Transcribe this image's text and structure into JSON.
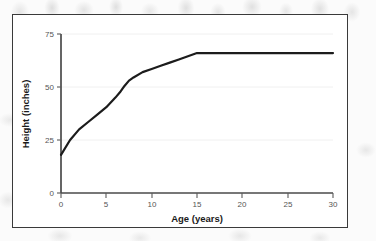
{
  "figure": {
    "panel_background": "#ffffff",
    "panel_border_color": "#3a3a3a",
    "page_background": "#fbfbfb"
  },
  "chart_data": {
    "type": "line",
    "title": "",
    "subtitle": "",
    "xlabel": "Age (years)",
    "ylabel": "Height (inches)",
    "xlim": [
      0,
      30
    ],
    "ylim": [
      0,
      75
    ],
    "xticks": [
      0,
      5,
      10,
      15,
      20,
      25,
      30
    ],
    "xtick_labels": [
      "0",
      "5",
      "10",
      "15",
      "20",
      "25",
      "30"
    ],
    "yticks": [
      0,
      25,
      50,
      75
    ],
    "ytick_labels": [
      "0",
      "25",
      "50",
      "75"
    ],
    "grid": "horizontal",
    "grid_color": "#f0f0f0",
    "legend": "none",
    "line_color": "#1c1c1c",
    "line_width": 2.2,
    "x": [
      0,
      1,
      2,
      3,
      4,
      5,
      6,
      6.5,
      7,
      7.5,
      8,
      9,
      10,
      11,
      12,
      13,
      14,
      15,
      16,
      18,
      20,
      22,
      25,
      28,
      30
    ],
    "y": [
      18,
      25,
      30,
      33.5,
      37,
      40.5,
      45,
      47.5,
      50.5,
      53,
      54.5,
      57,
      58.5,
      60,
      61.5,
      63,
      64.5,
      66,
      66,
      66,
      66,
      66,
      66,
      66,
      66
    ],
    "series": [
      {
        "name": "Height",
        "values": [
          18,
          25,
          30,
          33.5,
          37,
          40.5,
          45,
          47.5,
          50.5,
          53,
          54.5,
          57,
          58.5,
          60,
          61.5,
          63,
          64.5,
          66,
          66,
          66,
          66,
          66,
          66,
          66,
          66
        ]
      }
    ],
    "annotations": []
  }
}
